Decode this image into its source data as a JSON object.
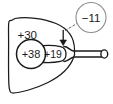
{
  "diagram": {
    "type": "line-diagram",
    "background_color": "#ffffff",
    "stroke_color": "#1a1a1a",
    "labels": {
      "cornea_power": "+30",
      "lens_nucleus_power": "+38",
      "lens_cortex_power": "+19",
      "callout_power": "−11"
    },
    "icons": {
      "down_arrow": "down-arrow-icon",
      "ring_terminal": "ring-terminal-icon",
      "callout_circle": "callout-circle-icon",
      "leader_line": "dashed-leader-line-icon"
    }
  }
}
